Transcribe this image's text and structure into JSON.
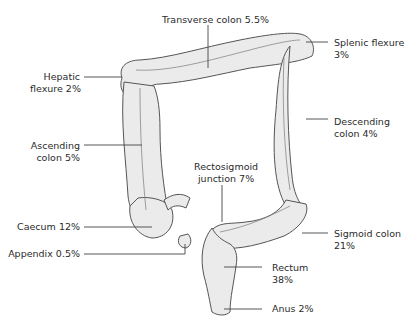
{
  "diagram": {
    "colors": {
      "organ_fill": "#ebebeb",
      "organ_stroke": "#555555",
      "leader": "#444444",
      "text": "#2b2b2b"
    },
    "labels": {
      "transverse": {
        "line1": "Transverse colon 5.5%"
      },
      "hepatic": {
        "line1": "Hepatic",
        "line2": "flexure 2%"
      },
      "splenic": {
        "line1": "Splenic flexure",
        "line2": "3%"
      },
      "descending": {
        "line1": "Descending",
        "line2": "colon 4%"
      },
      "ascending": {
        "line1": "Ascending",
        "line2": "colon 5%"
      },
      "rectosigmoid": {
        "line1": "Rectosigmoid",
        "line2": "junction 7%"
      },
      "caecum": {
        "line1": "Caecum 12%"
      },
      "appendix": {
        "line1": "Appendix 0.5%"
      },
      "sigmoid": {
        "line1": "Sigmoid colon",
        "line2": "21%"
      },
      "rectum": {
        "line1": "Rectum",
        "line2": "38%"
      },
      "anus": {
        "line1": "Anus 2%"
      }
    }
  }
}
